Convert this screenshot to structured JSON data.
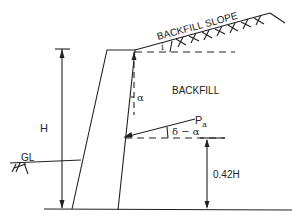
{
  "diagram": {
    "labels": {
      "backfill_slope": "BACKFILL SLOPE",
      "backfill": "BACKFILL",
      "height": "H",
      "alpha": "α",
      "slope_angle": "i",
      "pa_main": "P",
      "pa_sub": "a",
      "delta_alpha": "δ − α",
      "resultant_height": "0.42H",
      "ground_level": "GL"
    },
    "colors": {
      "line": "#222222",
      "background": "#ffffff"
    }
  }
}
